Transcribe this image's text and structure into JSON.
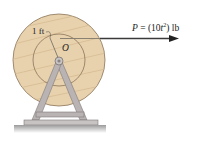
{
  "figure": {
    "force_label": {
      "symbol": "P",
      "equals": " = (10",
      "variable": "t",
      "exponent": "2",
      "unit": ") lb"
    },
    "radius_label": "1 ft",
    "center_label": "O"
  },
  "colors": {
    "wood": "#e8d2ae",
    "wood_grain": "#d2b88e",
    "outline": "#5a4a3a",
    "frame": "#b9b3b3",
    "frame_dark": "#7f7878",
    "ground": "#a9a9a9",
    "rope": "#6b6358",
    "arrow": "#222222"
  }
}
